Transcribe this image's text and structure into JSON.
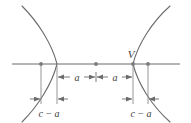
{
  "figure": {
    "kind": "hyperbola-geometry-diagram",
    "title": "",
    "background_color": "#ffffff",
    "curve_color": "#6b6b6b",
    "axis_color": "#6b6b6b",
    "guide_color": "#8a8a8a",
    "point_color": "#7a7a7a",
    "text_color": "#3d3d3d"
  },
  "axis": {
    "name": "transverse-axis",
    "x_start": 12,
    "x_end": 180,
    "y": 64
  },
  "points": [
    {
      "name": "left-focus",
      "label": "",
      "x": 41,
      "y": 64
    },
    {
      "name": "center",
      "label": "",
      "x": 96,
      "y": 64
    },
    {
      "name": "right-vertex",
      "label": "V",
      "x": 133,
      "y": 64
    },
    {
      "name": "right-focus",
      "label": "",
      "x": 148,
      "y": 64
    }
  ],
  "labels": {
    "vertex_v": "V",
    "semi_axis_left": "a",
    "semi_axis_right": "a",
    "focal_gap_left": "c − a",
    "focal_gap_right": "c − a"
  },
  "dimensions": [
    {
      "name": "semi-axis-left",
      "label": "a",
      "from_x": 57,
      "to_x": 96,
      "y": 77
    },
    {
      "name": "semi-axis-right",
      "label": "a",
      "from_x": 96,
      "to_x": 133,
      "y": 77
    },
    {
      "name": "focus-to-vertex-left",
      "label": "c − a",
      "from_x": 41,
      "to_x": 57,
      "y": 99
    },
    {
      "name": "focus-to-vertex-right",
      "label": "c − a",
      "from_x": 133,
      "to_x": 148,
      "y": 99
    }
  ],
  "guides": [
    {
      "name": "guide-left-focus",
      "x": 41,
      "y_top": 66,
      "y_bottom": 104
    },
    {
      "name": "guide-left-vertex",
      "x": 57,
      "y_top": 66,
      "y_bottom": 104
    },
    {
      "name": "guide-right-vertex",
      "x": 133,
      "y_top": 66,
      "y_bottom": 104
    },
    {
      "name": "guide-right-focus",
      "x": 148,
      "y_top": 66,
      "y_bottom": 104
    }
  ],
  "branches": [
    {
      "name": "left-branch",
      "vertex_x": 57,
      "opens": "left",
      "path": "M 22 6 C 38 22 52 44 57 64 C 52 84 38 106 22 122"
    },
    {
      "name": "right-branch",
      "vertex_x": 133,
      "opens": "right",
      "path": "M 170 6 C 152 22 138 44 133 64 C 138 84 152 106 170 122"
    }
  ]
}
